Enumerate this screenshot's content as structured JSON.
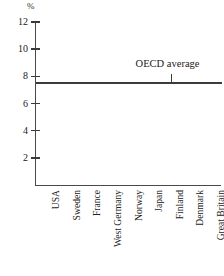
{
  "chart_data": {
    "type": "bar",
    "title": "",
    "subtitle": "",
    "xlabel": "",
    "ylabel": "%",
    "unit_label": "%",
    "categories": [
      "USA",
      "Sweden",
      "France",
      "West Germany",
      "Norway",
      "Japan",
      "Finland",
      "Denmark",
      "Great Britain"
    ],
    "values": [
      10.8,
      9.5,
      9.35,
      8.25,
      7.15,
      7.1,
      7.0,
      6.75,
      6.3
    ],
    "series": [
      {
        "name": "Share of GDP",
        "values": [
          10.8,
          9.5,
          9.35,
          8.25,
          7.15,
          7.1,
          7.0,
          6.75,
          6.3
        ]
      }
    ],
    "ylim": [
      0,
      12
    ],
    "yticks": [
      2,
      4,
      6,
      8,
      10,
      12
    ],
    "ytick_labels": [
      "2",
      "4",
      "6",
      "8",
      "10",
      "12"
    ],
    "grid": false,
    "legend": null,
    "bar_color": "#111111",
    "axis_color": "#4a4a4a",
    "annotations": [
      {
        "label": "OECD average",
        "type": "reference-line",
        "value": 7.55,
        "orientation": "horizontal"
      }
    ]
  },
  "axis": {
    "unit": "%",
    "ticks": [
      "12",
      "10",
      "8",
      "6",
      "4",
      "2"
    ]
  },
  "annotation": {
    "oecd_label": "OECD average"
  }
}
